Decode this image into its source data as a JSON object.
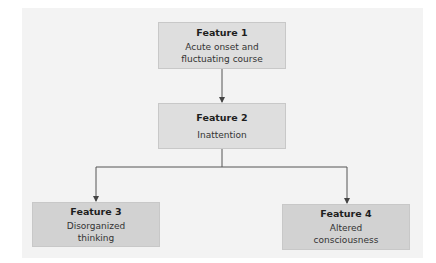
{
  "diagram": {
    "type": "flowchart",
    "colors": {
      "panel_bg": "#f3f3f3",
      "box_light": "#dedede",
      "box_dark": "#d2d2d2",
      "line": "#555555"
    },
    "nodes": [
      {
        "id": "feature1",
        "title": "Feature 1",
        "desc_line1": "Acute onset and",
        "desc_line2": "fluctuating course"
      },
      {
        "id": "feature2",
        "title": "Feature 2",
        "desc_line1": "Inattention",
        "desc_line2": ""
      },
      {
        "id": "feature3",
        "title": "Feature 3",
        "desc_line1": "Disorganized",
        "desc_line2": "thinking"
      },
      {
        "id": "feature4",
        "title": "Feature 4",
        "desc_line1": "Altered",
        "desc_line2": "consciousness"
      }
    ],
    "edges": [
      {
        "from": "feature1",
        "to": "feature2"
      },
      {
        "from": "feature2",
        "to": "feature3"
      },
      {
        "from": "feature2",
        "to": "feature4"
      }
    ]
  }
}
